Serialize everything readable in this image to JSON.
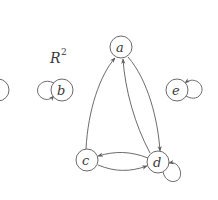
{
  "diagram": {
    "title": "R",
    "title_superscript": "2",
    "colors": {
      "stroke": "#6a6a6a",
      "text": "#3a3a3a",
      "background": "#ffffff"
    },
    "nodes": [
      {
        "id": "partial",
        "label": "",
        "x": -2,
        "y": 90
      },
      {
        "id": "a",
        "label": "a",
        "x": 121,
        "y": 47
      },
      {
        "id": "b",
        "label": "b",
        "x": 62,
        "y": 90
      },
      {
        "id": "c",
        "label": "c",
        "x": 87,
        "y": 160
      },
      {
        "id": "d",
        "label": "d",
        "x": 158,
        "y": 162
      },
      {
        "id": "e",
        "label": "e",
        "x": 177,
        "y": 90
      }
    ],
    "edges": [
      {
        "from": "c",
        "to": "a"
      },
      {
        "from": "d",
        "to": "a"
      },
      {
        "from": "a",
        "to": "d"
      },
      {
        "from": "c",
        "to": "d"
      },
      {
        "from": "d",
        "to": "c"
      },
      {
        "from": "b",
        "to": "b",
        "type": "self-loop"
      },
      {
        "from": "d",
        "to": "d",
        "type": "self-loop"
      },
      {
        "from": "e",
        "to": "e",
        "type": "self-loop"
      }
    ]
  }
}
